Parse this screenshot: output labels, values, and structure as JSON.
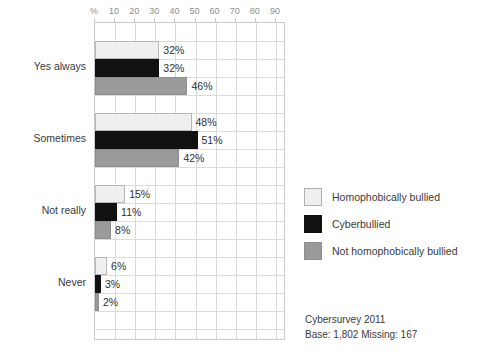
{
  "chart_data": {
    "type": "bar",
    "orientation": "horizontal",
    "title": "",
    "xlabel": "%",
    "ylabel": "",
    "xlim": [
      0,
      95
    ],
    "xticks": [
      "%",
      "10",
      "20",
      "30",
      "40",
      "50",
      "60",
      "70",
      "80",
      "90"
    ],
    "xtick_values": [
      0,
      10,
      20,
      30,
      40,
      50,
      60,
      70,
      80,
      90
    ],
    "grid": true,
    "categories": [
      "Yes always",
      "Sometimes",
      "Not really",
      "Never"
    ],
    "series": [
      {
        "name": "Homophobically bullied",
        "color": "#efefef",
        "values": [
          32,
          48,
          15,
          6
        ],
        "labels": [
          "32%",
          "48%",
          "15%",
          "6%"
        ]
      },
      {
        "name": "Cyberbullied",
        "color": "#111111",
        "values": [
          32,
          51,
          11,
          3
        ],
        "labels": [
          "32%",
          "51%",
          "11%",
          "3%"
        ]
      },
      {
        "name": "Not homophobically bullied",
        "color": "#9a9a9a",
        "values": [
          46,
          42,
          8,
          2
        ],
        "labels": [
          "46%",
          "42%",
          "8%",
          "2%"
        ]
      }
    ],
    "legend_position": "right",
    "annotations": [
      "Cybersurvey 2011",
      "Base: 1,802  Missing: 167"
    ]
  },
  "legend": {
    "items": [
      {
        "label": "Homophobically bullied",
        "color": "#efefef"
      },
      {
        "label": "Cyberbullied",
        "color": "#111111"
      },
      {
        "label": "Not homophobically bullied",
        "color": "#9a9a9a"
      }
    ]
  },
  "caption": {
    "line1": "Cybersurvey 2011",
    "line2": "Base: 1,802  Missing: 167"
  }
}
